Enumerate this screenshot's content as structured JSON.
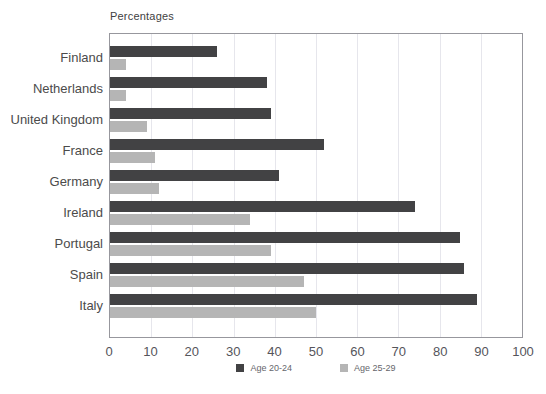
{
  "chart_data": {
    "type": "bar",
    "orientation": "horizontal",
    "title": "Percentages",
    "categories": [
      "Finland",
      "Netherlands",
      "United Kingdom",
      "France",
      "Germany",
      "Ireland",
      "Portugal",
      "Spain",
      "Italy"
    ],
    "series": [
      {
        "name": "Age 20-24",
        "color": "#424244",
        "values": [
          26,
          38,
          39,
          52,
          41,
          74,
          85,
          86,
          89
        ]
      },
      {
        "name": "Age 25-29",
        "color": "#b5b5b5",
        "values": [
          4,
          4,
          9,
          11,
          12,
          34,
          39,
          47,
          50
        ]
      }
    ],
    "xlabel": "",
    "ylabel": "",
    "xlim": [
      0,
      100
    ],
    "xticks": [
      0,
      10,
      20,
      30,
      40,
      50,
      60,
      70,
      80,
      90,
      100
    ],
    "grid": true,
    "gridline_color": "#e6e6ec",
    "plot_border_color": "#97979d",
    "legend_position": "bottom-center"
  }
}
